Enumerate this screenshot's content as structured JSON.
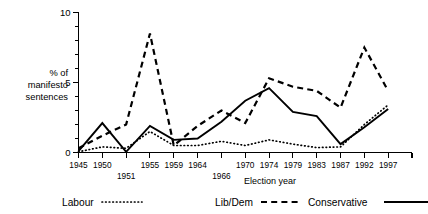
{
  "chart_data": {
    "type": "line",
    "title": "",
    "xlabel": "Election year",
    "ylabel": "% of manifesto sentences",
    "ylabel_lines": [
      "% of",
      "manifesto",
      "sentences"
    ],
    "categories": [
      "1945",
      "1950",
      "1951",
      "1955",
      "1959",
      "1964",
      "1966",
      "1970",
      "1974",
      "1979",
      "1983",
      "1987",
      "1992",
      "1997"
    ],
    "xtick_labels_row1": [
      "1945",
      "1950",
      "",
      "1955",
      "1959",
      "1964",
      "",
      "1970",
      "1974",
      "1979",
      "1983",
      "1987",
      "1992",
      "1997"
    ],
    "xtick_labels_row2": [
      "",
      "",
      "1951",
      "",
      "",
      "",
      "1966",
      "",
      "",
      "",
      "",
      "",
      "",
      ""
    ],
    "ylim": [
      0,
      10
    ],
    "xlim_note": "ticks at each election year plus one extra minor tick after 1997",
    "yticks": [
      0,
      5,
      10
    ],
    "ytick_labels": [
      "0",
      "5",
      "10"
    ],
    "yminor_step": 1,
    "grid": false,
    "legend_position": "below-axis",
    "series": [
      {
        "name": "Labour",
        "style": "dotted",
        "values": [
          0.05,
          0.4,
          0.3,
          1.5,
          0.5,
          0.5,
          0.8,
          0.5,
          0.9,
          0.6,
          0.35,
          0.4,
          2.0,
          3.4
        ]
      },
      {
        "name": "Lib/Dem",
        "style": "dashed",
        "values": [
          0.3,
          1.2,
          2.0,
          8.5,
          0.5,
          1.9,
          3.0,
          2.1,
          5.3,
          4.7,
          4.4,
          3.2,
          7.5,
          4.4
        ]
      },
      {
        "name": "Conservative",
        "style": "solid",
        "values": [
          0.1,
          2.1,
          0.05,
          1.9,
          0.9,
          1.0,
          2.2,
          3.7,
          4.6,
          2.9,
          2.6,
          0.6,
          1.8,
          3.1
        ]
      }
    ]
  },
  "legend": {
    "items": [
      {
        "label": "Labour",
        "style": "dotted"
      },
      {
        "label": "Lib/Dem",
        "style": "dashed"
      },
      {
        "label": "Conservative",
        "style": "solid"
      }
    ]
  },
  "colors": {
    "ink": "#000000",
    "background": "#ffffff"
  }
}
